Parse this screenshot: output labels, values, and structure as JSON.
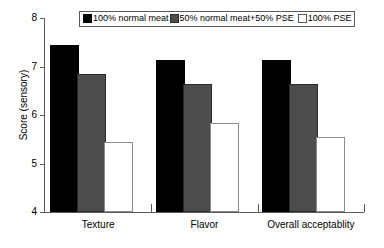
{
  "chart_data": {
    "type": "bar",
    "title": "",
    "xlabel": "",
    "ylabel": "Score (sensory)",
    "ylim": [
      4,
      8
    ],
    "yticks": [
      "4",
      "5",
      "6",
      "7",
      "8"
    ],
    "grid": false,
    "legend_position": "top-center",
    "categories": [
      "Texture",
      "Flavor",
      "Overall acceptablity"
    ],
    "series": [
      {
        "name": "100% normal meat",
        "swatch": "black-filled-square",
        "color": "#000000",
        "values": [
          7.4,
          7.1,
          7.1
        ]
      },
      {
        "name": "50% normal meat+50% PSE",
        "swatch": "gray-filled-square",
        "color": "#4d4d4d",
        "values": [
          6.8,
          6.6,
          6.6
        ]
      },
      {
        "name": "100% PSE",
        "swatch": "white-open-square",
        "color": "#ffffff",
        "values": [
          5.4,
          5.8,
          5.5
        ]
      }
    ]
  }
}
